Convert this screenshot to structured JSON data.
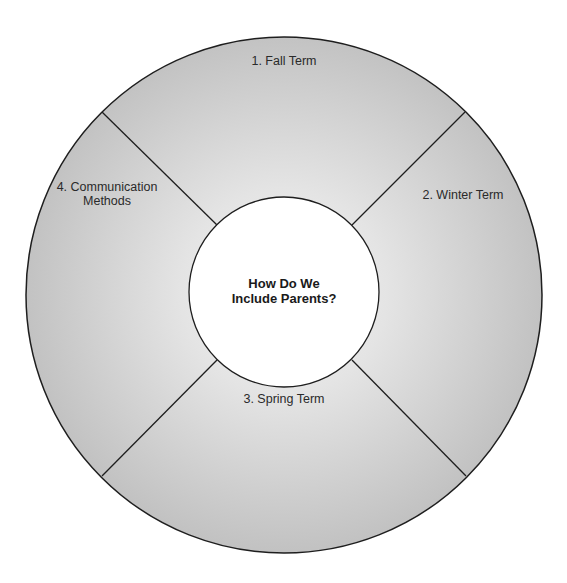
{
  "diagram": {
    "title": "How Do We Include Parents?",
    "center": {
      "line1": "How Do We",
      "line2": "Include Parents?"
    },
    "segments": [
      {
        "number": "1.",
        "label": "Fall Term",
        "position": "top"
      },
      {
        "number": "2.",
        "label": "Winter Term",
        "position": "right"
      },
      {
        "number": "3.",
        "label": "Spring Term",
        "position": "bottom"
      },
      {
        "number": "4.",
        "label": "Communication Methods",
        "line1": "4.  Communication",
        "line2": "Methods",
        "position": "left"
      }
    ],
    "labels": {
      "fall": "1.  Fall Term",
      "winter": "2.  Winter Term",
      "spring": "3.  Spring Term",
      "comm_line1": "4.  Communication",
      "comm_line2": "Methods"
    },
    "colors": {
      "ring_fill_edge": "#c4c4c4",
      "ring_fill_center": "#ececec",
      "stroke": "#1e1e1e",
      "center_fill": "#ffffff"
    }
  }
}
